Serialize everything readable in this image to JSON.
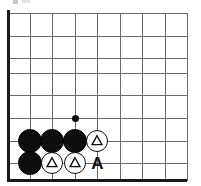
{
  "diagram": {
    "type": "go-board-corner",
    "board": {
      "width": 201,
      "height": 186,
      "grid_spacing": 22.5,
      "line_color": "#6b6b6b",
      "edge_color": "#1a1a1a",
      "background_color": "#ffffff",
      "vertical_lines_x": [
        8,
        30,
        52,
        75,
        97,
        120,
        142,
        165,
        187
      ],
      "horizontal_lines_y": [
        13,
        36,
        58,
        73,
        95,
        118,
        141,
        163,
        180
      ],
      "left_edge_x": 8,
      "bottom_edge_y": 180
    },
    "stones": [
      {
        "id": "b1",
        "color": "black",
        "x": 30,
        "y": 141,
        "radius": 12,
        "mark": "none",
        "label": ""
      },
      {
        "id": "b2",
        "color": "black",
        "x": 52,
        "y": 141,
        "radius": 12,
        "mark": "none",
        "label": ""
      },
      {
        "id": "b3",
        "color": "black",
        "x": 75,
        "y": 141,
        "radius": 12,
        "mark": "none",
        "label": ""
      },
      {
        "id": "b4",
        "color": "black",
        "x": 30,
        "y": 163,
        "radius": 12,
        "mark": "none",
        "label": ""
      },
      {
        "id": "w1",
        "color": "white",
        "x": 97,
        "y": 141,
        "radius": 11,
        "mark": "triangle",
        "label": ""
      },
      {
        "id": "w2",
        "color": "white",
        "x": 52,
        "y": 163,
        "radius": 11,
        "mark": "triangle",
        "label": ""
      },
      {
        "id": "w3",
        "color": "white",
        "x": 75,
        "y": 163,
        "radius": 11,
        "mark": "triangle",
        "label": ""
      }
    ],
    "markers": [
      {
        "id": "dot1",
        "kind": "move-dot",
        "x": 75,
        "y": 118,
        "radius": 3.5,
        "color": "#0d0d0d"
      }
    ],
    "point_labels": [
      {
        "id": "labelA",
        "text": "A",
        "x": 97,
        "y": 163,
        "font_size": 17
      }
    ],
    "counts": {
      "black_stones": 4,
      "white_stones": 3,
      "triangle_marks": 3,
      "point_labels": 1,
      "move_dots": 1
    },
    "colors": {
      "black_stone": "#0d0d0d",
      "white_stone": "#ffffff",
      "stone_outline": "#0d0d0d",
      "grid": "#6b6b6b",
      "board_edge": "#1a1a1a"
    }
  }
}
